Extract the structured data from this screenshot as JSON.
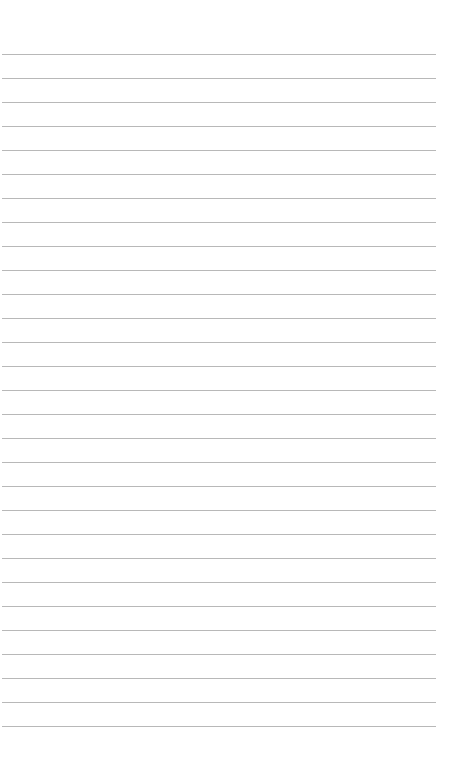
{
  "page": {
    "type": "lined-paper",
    "background": "#ffffff",
    "rule_color": "#b8b8b8",
    "rule_count": 29,
    "first_rule_y": 54,
    "rule_spacing": 24.0,
    "rule_left": 2,
    "rule_width": 434
  }
}
